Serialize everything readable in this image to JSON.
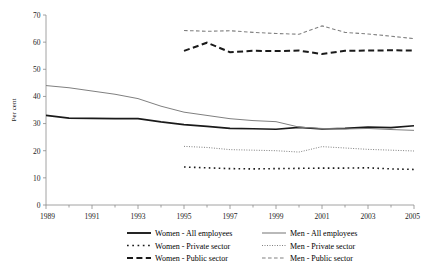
{
  "chart_data": {
    "type": "line",
    "title": "",
    "subtitle": "",
    "xlabel": "",
    "ylabel": "Per cent",
    "xlim": [
      1989,
      2005
    ],
    "ylim": [
      0,
      70
    ],
    "ytick_step": 10,
    "xtick_step": 2,
    "grid": false,
    "legend_position": "bottom",
    "yticks": [
      "0",
      "10",
      "20",
      "30",
      "40",
      "50",
      "60",
      "70"
    ],
    "xticks": [
      "1989",
      "1991",
      "1993",
      "1995",
      "1997",
      "1999",
      "2001",
      "2003",
      "2005"
    ],
    "x": [
      1989,
      1990,
      1991,
      1992,
      1993,
      1994,
      1995,
      1996,
      1997,
      1998,
      1999,
      2000,
      2001,
      2002,
      2003,
      2004,
      2005
    ],
    "series": [
      {
        "name": "Women - All employees",
        "style": "solid",
        "color": "#1a1a1a",
        "width": 1.7,
        "x": [
          1989,
          1990,
          1991,
          1992,
          1993,
          1994,
          1995,
          1996,
          1997,
          1998,
          1999,
          2000,
          2001,
          2002,
          2003,
          2004,
          2005
        ],
        "values": [
          33.0,
          32.0,
          31.9,
          31.8,
          31.8,
          30.6,
          29.6,
          29.0,
          28.2,
          28.1,
          27.9,
          28.6,
          28.0,
          28.2,
          28.7,
          28.5,
          29.2
        ]
      },
      {
        "name": "Men - All employees",
        "style": "solid",
        "color": "#808080",
        "width": 1.0,
        "x": [
          1989,
          1990,
          1991,
          1992,
          1993,
          1994,
          1995,
          1996,
          1997,
          1998,
          1999,
          2000,
          2001,
          2002,
          2003,
          2004,
          2005
        ],
        "values": [
          44.0,
          43.2,
          42.0,
          40.8,
          39.2,
          36.4,
          34.2,
          33.0,
          31.8,
          31.1,
          30.7,
          28.7,
          28.2,
          28.0,
          28.2,
          27.8,
          27.5
        ]
      },
      {
        "name": "Women - Private sector",
        "style": "dotted-square",
        "color": "#1a1a1a",
        "width": 1.6,
        "x": [
          1995,
          1996,
          1997,
          1998,
          1999,
          2000,
          2001,
          2002,
          2003,
          2004,
          2005
        ],
        "values": [
          14.0,
          13.7,
          13.4,
          13.3,
          13.4,
          13.5,
          13.6,
          13.6,
          13.7,
          13.3,
          13.1
        ]
      },
      {
        "name": "Men - Private sector",
        "style": "fine-dotted",
        "color": "#808080",
        "width": 1.0,
        "x": [
          1995,
          1996,
          1997,
          1998,
          1999,
          2000,
          2001,
          2002,
          2003,
          2004,
          2005
        ],
        "values": [
          21.6,
          21.2,
          20.4,
          20.2,
          20.0,
          19.5,
          21.5,
          21.0,
          20.5,
          20.2,
          19.9
        ]
      },
      {
        "name": "Women - Public sector",
        "style": "dashed-long",
        "color": "#1a1a1a",
        "width": 2.0,
        "x": [
          1995,
          1996,
          1997,
          1998,
          1999,
          2000,
          2001,
          2002,
          2003,
          2004,
          2005
        ],
        "values": [
          56.8,
          59.8,
          56.3,
          56.8,
          56.7,
          56.9,
          55.6,
          56.8,
          56.9,
          57.0,
          56.9
        ]
      },
      {
        "name": "Men - Public sector",
        "style": "dashed-short",
        "color": "#808080",
        "width": 1.1,
        "x": [
          1995,
          1996,
          1997,
          1998,
          1999,
          2000,
          2001,
          2002,
          2003,
          2004,
          2005
        ],
        "values": [
          64.3,
          64.0,
          64.2,
          63.6,
          63.2,
          62.9,
          66.0,
          63.6,
          63.0,
          62.2,
          61.3
        ]
      }
    ]
  },
  "axis": {
    "ylabel": "Per cent"
  },
  "legend": {
    "items": [
      {
        "label": "Women - All employees",
        "style": "solid",
        "color": "#1a1a1a",
        "width": 1.9
      },
      {
        "label": "Men - All employees",
        "style": "solid",
        "color": "#808080",
        "width": 1.1
      },
      {
        "label": "Women - Private sector",
        "style": "dotted-square",
        "color": "#1a1a1a",
        "width": 1.7
      },
      {
        "label": "Men - Private sector",
        "style": "fine-dotted",
        "color": "#808080",
        "width": 1.1
      },
      {
        "label": "Women - Public sector",
        "style": "dashed-long",
        "color": "#1a1a1a",
        "width": 2.1
      },
      {
        "label": "Men - Public sector",
        "style": "dashed-short",
        "color": "#808080",
        "width": 1.2
      }
    ]
  }
}
